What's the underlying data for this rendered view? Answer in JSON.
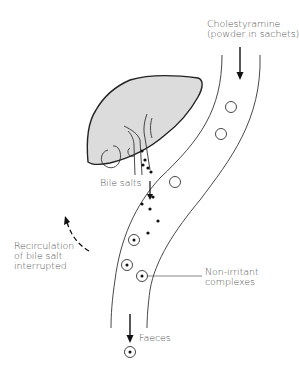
{
  "diagram": {
    "labels": {
      "drug_line1": "Cholestyramine",
      "drug_line2": "(powder in sachets)",
      "bile_salts": "Bile salts",
      "recirc_line1": "Recirculation",
      "recirc_line2": "of bile salt",
      "recirc_line3": "interrupted",
      "complexes_line1": "Non-irritant",
      "complexes_line2": "complexes",
      "faeces": "Faeces"
    },
    "colors": {
      "line": "#222222",
      "liver_fill": "#dcdcdc",
      "text": "#555555",
      "background": "#ffffff"
    },
    "elements": {
      "organ": "liver",
      "tube": "intestine",
      "markers": [
        "bile-salt-dot",
        "cholestyramine-particle",
        "non-irritant-complex"
      ]
    }
  }
}
